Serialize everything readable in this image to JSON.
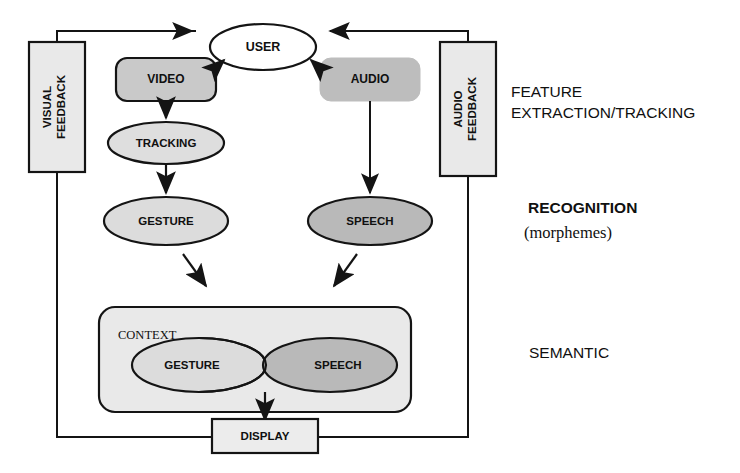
{
  "diagram": {
    "colors": {
      "stroke": "#141414",
      "fill_light": "#e6e6e6",
      "fill_medium": "#d0d0d0",
      "fill_dark": "#b5b5b5",
      "background": "#ffffff"
    },
    "nodes": {
      "user": {
        "label": "USER",
        "shape": "ellipse",
        "fill": "#ffffff"
      },
      "video": {
        "label": "VIDEO",
        "shape": "rounded-rect",
        "fill": "#c9c9c9"
      },
      "audio": {
        "label": "AUDIO",
        "shape": "rounded-rect",
        "fill": "#bdbdbd"
      },
      "visual_feedback": {
        "label": "VISUAL\nFEEDBACK",
        "line1": "VISUAL",
        "line2": "FEEDBACK",
        "shape": "rect",
        "fill": "#e9e9e9",
        "orientation": "vertical"
      },
      "audio_feedback": {
        "label": "AUDIO\nFEEDBACK",
        "line1": "AUDIO",
        "line2": "FEEDBACK",
        "shape": "rect",
        "fill": "#e9e9e9",
        "orientation": "vertical"
      },
      "tracking": {
        "label": "TRACKING",
        "shape": "ellipse",
        "fill": "#dedede"
      },
      "gesture": {
        "label": "GESTURE",
        "shape": "ellipse",
        "fill": "#dcdcdc"
      },
      "speech": {
        "label": "SPEECH",
        "shape": "ellipse",
        "fill": "#b9b9b9"
      },
      "context": {
        "label": "CONTEXT",
        "shape": "rounded-rect",
        "fill": "#e9e9e9"
      },
      "context_gesture": {
        "label": "GESTURE",
        "shape": "ellipse",
        "fill": "#dcdcdc"
      },
      "context_speech": {
        "label": "SPEECH",
        "shape": "ellipse",
        "fill": "#b9b9b9"
      },
      "display": {
        "label": "DISPLAY",
        "shape": "rect",
        "fill": "#ececec"
      }
    },
    "stage_labels": [
      {
        "id": "feature-extraction",
        "line1": "FEATURE",
        "line2": "EXTRACTION/TRACKING",
        "style": "regular"
      },
      {
        "id": "recognition",
        "line1": "RECOGNITION",
        "line2": "(morphemes)",
        "style": "bold-then-serif"
      },
      {
        "id": "semantic",
        "line1": "SEMANTIC",
        "line2": "",
        "style": "regular"
      }
    ]
  }
}
